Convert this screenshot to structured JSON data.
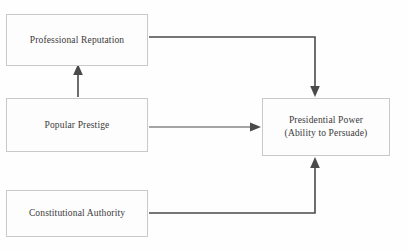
{
  "diagram": {
    "background_color": "#fefefe",
    "box_border_color": "#c9c9c9",
    "connector_color": "#4a4a4a",
    "nodes": [
      {
        "id": "professional-reputation",
        "label": "Professional Reputation",
        "label_line2": ""
      },
      {
        "id": "popular-prestige",
        "label": "Popular Prestige",
        "label_line2": ""
      },
      {
        "id": "constitutional-authority",
        "label": "Constitutional Authority",
        "label_line2": ""
      },
      {
        "id": "presidential-power",
        "label": "Presidential Power",
        "label_line2": "(Ability to Persuade)"
      }
    ],
    "edges": [
      {
        "id": "popular-prestige-to-professional-reputation",
        "from": "popular-prestige",
        "to": "professional-reputation",
        "style": "straight-vertical-arrow"
      },
      {
        "id": "professional-reputation-to-presidential-power",
        "from": "professional-reputation",
        "to": "presidential-power",
        "style": "elbow-right-down-arrow"
      },
      {
        "id": "popular-prestige-to-presidential-power",
        "from": "popular-prestige",
        "to": "presidential-power",
        "style": "straight-horizontal-arrow"
      },
      {
        "id": "constitutional-authority-to-presidential-power",
        "from": "constitutional-authority",
        "to": "presidential-power",
        "style": "elbow-right-up-arrow"
      }
    ]
  }
}
